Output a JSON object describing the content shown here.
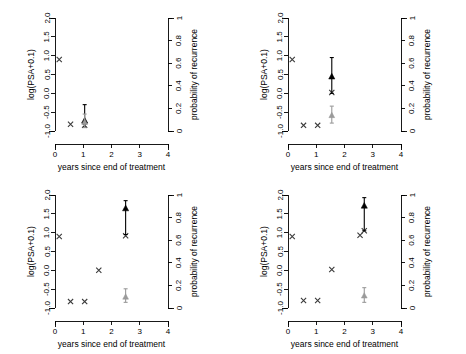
{
  "figure": {
    "panel_count": 4,
    "layout": "2x2 grid"
  },
  "axes": {
    "xlabel": "years since end of treatment",
    "ylabel_left": "log(PSA+0.1)",
    "ylabel_right": "probability of recurrence",
    "x_ticks": [
      "0",
      "1",
      "2",
      "3",
      "4"
    ],
    "x_tick_values": [
      0,
      1,
      2,
      3,
      4
    ],
    "y_left_ticks": [
      "-1.0",
      "-0.5",
      "0.0",
      "0.5",
      "1.0",
      "1.5",
      "2.0"
    ],
    "y_left_tick_values": [
      -1.0,
      -0.5,
      0.0,
      0.5,
      1.0,
      1.5,
      2.0
    ],
    "y_right_ticks": [
      "0",
      "0.2",
      "0.4",
      "0.6",
      "0.8",
      "1"
    ],
    "y_right_tick_values": [
      0,
      0.2,
      0.4,
      0.6,
      0.8,
      1
    ],
    "xlim": [
      0,
      4
    ],
    "ylim_left": [
      -1.0,
      2.0
    ],
    "ylim_right": [
      0,
      1
    ]
  },
  "colors": {
    "observed": "#3a3a3a",
    "prediction": "#000000",
    "probability": "#9a9a9a",
    "axis": "#000000",
    "background": "#ffffff"
  },
  "chart_data": [
    {
      "type": "scatter",
      "panel_index": 1,
      "title": "",
      "xlabel": "years since end of treatment",
      "ylabel": "log(PSA+0.1)",
      "ylabel_right": "probability of recurrence",
      "xlim": [
        0,
        4
      ],
      "ylim": [
        -1.0,
        2.0
      ],
      "grid": false,
      "legend": "none",
      "series": [
        {
          "name": "observed log(PSA+0.1)",
          "marker": "x",
          "x": [
            0.15,
            0.55,
            1.05
          ],
          "y": [
            0.9,
            -0.82,
            -0.85
          ]
        },
        {
          "name": "predicted log(PSA+0.1)",
          "marker": "filled-triangle",
          "x": [
            1.05
          ],
          "y": [
            -0.72
          ],
          "err_low": [
            -0.9
          ],
          "err_high": [
            -0.3
          ]
        },
        {
          "name": "probability of recurrence",
          "marker": "filled-triangle-gray",
          "axis": "right",
          "x": [
            1.05
          ],
          "y_prob": [
            0.08
          ],
          "err_low_prob": [
            0.03
          ],
          "err_high_prob": [
            0.15
          ]
        }
      ]
    },
    {
      "type": "scatter",
      "panel_index": 2,
      "title": "",
      "xlabel": "years since end of treatment",
      "ylabel": "log(PSA+0.1)",
      "ylabel_right": "probability of recurrence",
      "xlim": [
        0,
        4
      ],
      "ylim": [
        -1.0,
        2.0
      ],
      "grid": false,
      "legend": "none",
      "series": [
        {
          "name": "observed log(PSA+0.1)",
          "marker": "x",
          "x": [
            0.15,
            0.55,
            1.05,
            1.55
          ],
          "y": [
            0.9,
            -0.85,
            -0.85,
            0.02
          ]
        },
        {
          "name": "predicted log(PSA+0.1)",
          "marker": "filled-triangle",
          "x": [
            1.55
          ],
          "y": [
            0.45
          ],
          "err_low": [
            0.0
          ],
          "err_high": [
            0.95
          ]
        },
        {
          "name": "probability of recurrence",
          "marker": "filled-triangle-gray",
          "axis": "right",
          "x": [
            1.55
          ],
          "y_prob": [
            0.14
          ],
          "err_low_prob": [
            0.07
          ],
          "err_high_prob": [
            0.22
          ]
        }
      ]
    },
    {
      "type": "scatter",
      "panel_index": 3,
      "title": "",
      "xlabel": "years since end of treatment",
      "ylabel": "log(PSA+0.1)",
      "ylabel_right": "probability of recurrence",
      "xlim": [
        0,
        4
      ],
      "ylim": [
        -1.0,
        2.0
      ],
      "grid": false,
      "legend": "none",
      "series": [
        {
          "name": "observed log(PSA+0.1)",
          "marker": "x",
          "x": [
            0.15,
            0.55,
            1.05,
            1.55,
            2.5
          ],
          "y": [
            0.9,
            -0.83,
            -0.83,
            0.0,
            0.92
          ]
        },
        {
          "name": "predicted log(PSA+0.1)",
          "marker": "filled-triangle",
          "x": [
            2.5
          ],
          "y": [
            1.65
          ],
          "err_low": [
            0.95
          ],
          "err_high": [
            1.85
          ]
        },
        {
          "name": "probability of recurrence",
          "marker": "filled-triangle-gray",
          "axis": "right",
          "x": [
            2.5
          ],
          "y_prob": [
            0.1
          ],
          "err_low_prob": [
            0.05
          ],
          "err_high_prob": [
            0.17
          ]
        }
      ]
    },
    {
      "type": "scatter",
      "panel_index": 4,
      "title": "",
      "xlabel": "years since end of treatment",
      "ylabel": "log(PSA+0.1)",
      "ylabel_right": "probability of recurrence",
      "xlim": [
        0,
        4
      ],
      "ylim": [
        -1.0,
        2.0
      ],
      "grid": false,
      "legend": "none",
      "series": [
        {
          "name": "observed log(PSA+0.1)",
          "marker": "x",
          "x": [
            0.15,
            0.55,
            1.05,
            1.55,
            2.55,
            2.7
          ],
          "y": [
            0.9,
            -0.8,
            -0.8,
            0.02,
            0.93,
            1.05
          ]
        },
        {
          "name": "predicted log(PSA+0.1)",
          "marker": "filled-triangle",
          "x": [
            2.7
          ],
          "y": [
            1.72
          ],
          "err_low": [
            1.05
          ],
          "err_high": [
            1.93
          ]
        },
        {
          "name": "probability of recurrence",
          "marker": "filled-triangle-gray",
          "axis": "right",
          "x": [
            2.7
          ],
          "y_prob": [
            0.11
          ],
          "err_low_prob": [
            0.05
          ],
          "err_high_prob": [
            0.18
          ]
        }
      ]
    }
  ]
}
